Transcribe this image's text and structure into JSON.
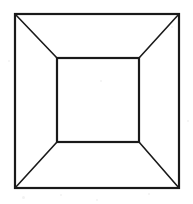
{
  "figure": {
    "name": "nested-square-perspective-illusion",
    "canvas": {
      "width": 193,
      "height": 204,
      "background_color": "#ffffff"
    },
    "style": {
      "stroke_color": "#1a1a1a",
      "outer_stroke_width": 2.2,
      "inner_stroke_width": 2.2,
      "diagonal_stroke_width": 1.6,
      "fill": "none"
    },
    "outer_square": {
      "label": "outer-square",
      "x1": 15,
      "y1": 14,
      "x2": 179,
      "y2": 188,
      "width": 164,
      "height": 174
    },
    "inner_square": {
      "label": "inner-square",
      "x1": 57,
      "y1": 58,
      "x2": 139,
      "y2": 142,
      "width": 82,
      "height": 84
    },
    "diagonals": [
      {
        "label": "diagonal-top-left",
        "x1": 15,
        "y1": 14,
        "x2": 57,
        "y2": 58
      },
      {
        "label": "diagonal-top-right",
        "x1": 179,
        "y1": 14,
        "x2": 139,
        "y2": 58
      },
      {
        "label": "diagonal-bottom-left",
        "x1": 15,
        "y1": 188,
        "x2": 57,
        "y2": 142
      },
      {
        "label": "diagonal-bottom-right",
        "x1": 179,
        "y1": 188,
        "x2": 139,
        "y2": 142
      }
    ],
    "speckles": [
      {
        "x": 22,
        "y": 196,
        "size": 3
      },
      {
        "x": 60,
        "y": 194,
        "size": 2
      },
      {
        "x": 96,
        "y": 199,
        "size": 2
      },
      {
        "x": 148,
        "y": 193,
        "size": 2
      },
      {
        "x": 8,
        "y": 60,
        "size": 2
      },
      {
        "x": 187,
        "y": 120,
        "size": 2
      },
      {
        "x": 171,
        "y": 26,
        "size": 2
      },
      {
        "x": 100,
        "y": 80,
        "size": 2
      }
    ]
  }
}
